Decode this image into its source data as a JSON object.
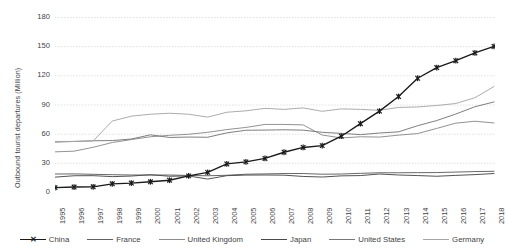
{
  "chart_data": {
    "type": "line",
    "title": "",
    "xlabel": "",
    "ylabel": "Outbound tourist departures (Million)",
    "ylim": [
      0,
      180
    ],
    "yticks": [
      0,
      30,
      60,
      90,
      120,
      150,
      180
    ],
    "grid": "horizontal",
    "legend_position": "bottom",
    "categories": [
      "1995",
      "1996",
      "1997",
      "1998",
      "1999",
      "2000",
      "2001",
      "2002",
      "2003",
      "2004",
      "2005",
      "2006",
      "2007",
      "2008",
      "2009",
      "2010",
      "2011",
      "2012",
      "2013",
      "2014",
      "2015",
      "2016",
      "2017",
      "2018"
    ],
    "series": [
      {
        "name": "China",
        "color": "#1a1a1a",
        "marker": "x",
        "values": [
          4.5,
          5.1,
          5.3,
          8.4,
          9.2,
          10.5,
          12.1,
          16.6,
          20.2,
          28.9,
          31.0,
          34.5,
          40.9,
          45.8,
          47.7,
          57.4,
          70.3,
          83.2,
          98.2,
          117.0,
          128.0,
          135.1,
          143.0,
          149.7
        ]
      },
      {
        "name": "France",
        "color": "#606060",
        "marker": "none",
        "values": [
          18.5,
          18.6,
          18.2,
          17.8,
          17.5,
          17.4,
          17.5,
          17.0,
          16.7,
          17.2,
          18.3,
          18.6,
          19.0,
          19.0,
          18.3,
          18.5,
          19.2,
          19.8,
          19.8,
          19.9,
          20.0,
          20.5,
          21.0,
          21.3
        ]
      },
      {
        "name": "United Kingdom",
        "color": "#8c8c8c",
        "marker": "none",
        "values": [
          41.3,
          42.0,
          46.0,
          50.9,
          53.9,
          56.8,
          58.3,
          59.4,
          61.4,
          64.2,
          66.4,
          69.5,
          69.5,
          69.0,
          58.6,
          55.6,
          56.8,
          56.5,
          58.5,
          60.1,
          65.4,
          70.8,
          72.8,
          71.0
        ]
      },
      {
        "name": "Japan",
        "color": "#4a4a4a",
        "marker": "none",
        "values": [
          15.3,
          16.7,
          16.8,
          15.8,
          16.4,
          17.8,
          16.2,
          16.5,
          13.3,
          16.8,
          17.4,
          17.5,
          17.3,
          16.0,
          15.4,
          16.6,
          16.9,
          18.5,
          17.5,
          16.9,
          16.2,
          17.1,
          17.9,
          19.0
        ]
      },
      {
        "name": "United States",
        "color": "#777777",
        "marker": "none",
        "values": [
          51.3,
          52.0,
          52.7,
          52.9,
          54.5,
          58.8,
          56.1,
          56.5,
          56.3,
          60.8,
          63.5,
          63.7,
          64.0,
          63.6,
          61.4,
          60.3,
          59.0,
          60.7,
          61.9,
          68.2,
          73.5,
          80.2,
          87.7,
          92.6
        ]
      },
      {
        "name": "Germany",
        "color": "#a6a6a6",
        "marker": "none",
        "values": [
          52.0,
          52.0,
          52.5,
          73.0,
          78.0,
          80.0,
          81.0,
          80.0,
          77.0,
          82.0,
          83.5,
          86.0,
          85.0,
          86.5,
          83.0,
          85.5,
          85.0,
          84.0,
          87.0,
          87.5,
          89.0,
          91.0,
          97.0,
          108.5
        ]
      }
    ]
  },
  "legend": {
    "items": [
      {
        "label": "China"
      },
      {
        "label": "France"
      },
      {
        "label": "United Kingdom"
      },
      {
        "label": "Japan"
      },
      {
        "label": "United States"
      },
      {
        "label": "Germany"
      }
    ]
  }
}
